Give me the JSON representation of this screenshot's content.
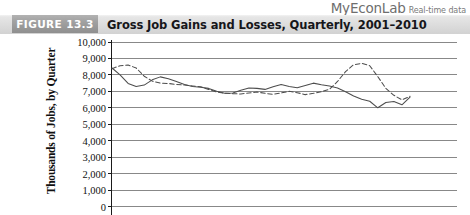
{
  "brand": {
    "name": "MyEconLab",
    "tagline": "Real-time data"
  },
  "figure": {
    "tag": "FIGURE 13.3",
    "title": "Gross Job Gains and Losses, Quarterly, 2001–2010"
  },
  "chart_data": {
    "type": "line",
    "title": "Gross Job Gains and Losses, Quarterly, 2001–2010",
    "xlabel": "",
    "ylabel": "Thousands of Jobs, by Quarter",
    "ylim": [
      0,
      10000
    ],
    "ytick_labels": [
      "10,000",
      "9,000",
      "8,000",
      "7,000",
      "6,000",
      "5,000",
      "4,000",
      "3,000",
      "2,000",
      "1,000",
      "0"
    ],
    "ytick_values": [
      10000,
      9000,
      8000,
      7000,
      6000,
      5000,
      4000,
      3000,
      2000,
      1000,
      0
    ],
    "grid": true,
    "legend_position": "none",
    "x": [
      "2001Q1",
      "2001Q2",
      "2001Q3",
      "2001Q4",
      "2002Q1",
      "2002Q2",
      "2002Q3",
      "2002Q4",
      "2003Q1",
      "2003Q2",
      "2003Q3",
      "2003Q4",
      "2004Q1",
      "2004Q2",
      "2004Q3",
      "2004Q4",
      "2005Q1",
      "2005Q2",
      "2005Q3",
      "2005Q4",
      "2006Q1",
      "2006Q2",
      "2006Q3",
      "2006Q4",
      "2007Q1",
      "2007Q2",
      "2007Q3",
      "2007Q4",
      "2008Q1",
      "2008Q2",
      "2008Q3",
      "2008Q4",
      "2009Q1",
      "2009Q2",
      "2009Q3",
      "2009Q4",
      "2010Q1",
      "2010Q2"
    ],
    "series": [
      {
        "name": "Gross job gains",
        "style": "solid",
        "color": "#4d4d4d",
        "values": [
          8420,
          8000,
          7480,
          7300,
          7380,
          7700,
          7880,
          7760,
          7600,
          7420,
          7300,
          7250,
          7180,
          7000,
          6880,
          6900,
          7060,
          7200,
          7180,
          7120,
          7280,
          7420,
          7300,
          7220,
          7360,
          7500,
          7400,
          7320,
          7200,
          6980,
          6720,
          6520,
          6400,
          6000,
          6320,
          6380,
          6180,
          6650
        ]
      },
      {
        "name": "Gross job losses",
        "style": "dashed",
        "color": "#4d4d4d",
        "values": [
          8380,
          8560,
          8600,
          8420,
          7920,
          7620,
          7500,
          7480,
          7420,
          7380,
          7330,
          7280,
          7120,
          6960,
          6880,
          6860,
          6840,
          6900,
          6960,
          6880,
          6820,
          6900,
          7000,
          6920,
          6800,
          6880,
          6980,
          7120,
          7600,
          8200,
          8620,
          8700,
          8560,
          7900,
          7180,
          6760,
          6480,
          6700
        ]
      }
    ],
    "annotations": []
  }
}
